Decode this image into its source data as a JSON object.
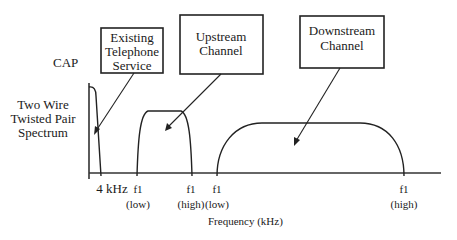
{
  "diagram": {
    "title": "CAP",
    "y_axis_label": [
      "Two Wire",
      "Twisted Pair",
      "Spectrum"
    ],
    "x_axis_label": "Frequency (kHz)",
    "callouts": {
      "telephone": [
        "Existing",
        "Telephone",
        "Service"
      ],
      "upstream": [
        "Upstream",
        "Channel"
      ],
      "downstream": [
        "Downstream",
        "Channel"
      ]
    },
    "ticks": [
      {
        "label": "4 kHz",
        "sub": ""
      },
      {
        "label": "f1",
        "sub": "(low)"
      },
      {
        "label": "f1",
        "sub": "(high)"
      },
      {
        "label": "f1",
        "sub": "(low)"
      },
      {
        "label": "f1",
        "sub": "(high)"
      }
    ],
    "bands": [
      {
        "name": "Existing Telephone Service",
        "start": "0",
        "end": "4 kHz"
      },
      {
        "name": "Upstream Channel",
        "start": "f1 (low)",
        "end": "f1 (high)"
      },
      {
        "name": "Downstream Channel",
        "start": "f1 (low)",
        "end": "f1 (high)"
      }
    ],
    "colors": {
      "ink": "#222222",
      "background": "#ffffff"
    }
  }
}
